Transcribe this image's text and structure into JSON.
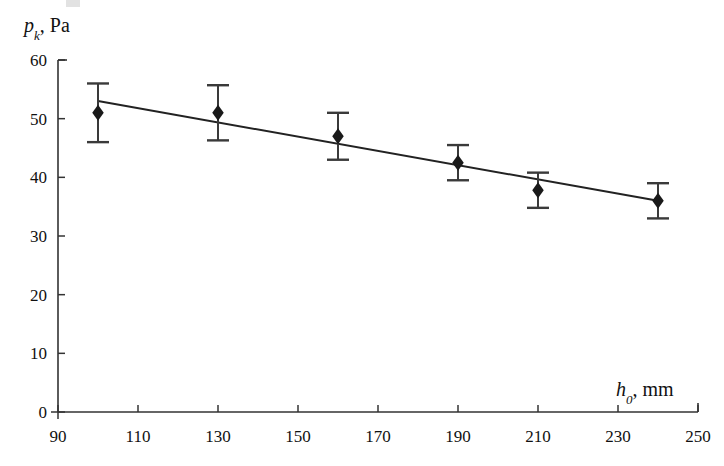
{
  "chart_data": {
    "type": "scatter",
    "title": "",
    "subtitle": "",
    "xlabel": "h_0, mm",
    "xlabel_parts": {
      "var": "h",
      "sub": "0",
      "rest": ", mm"
    },
    "ylabel": "p_k, Pa",
    "ylabel_parts": {
      "var": "p",
      "sub": "k",
      "rest": ", Pa"
    },
    "xlim": [
      90,
      250
    ],
    "ylim": [
      0,
      60
    ],
    "xticks": [
      90,
      110,
      130,
      150,
      170,
      190,
      210,
      230,
      250
    ],
    "yticks": [
      0,
      10,
      20,
      30,
      40,
      50,
      60
    ],
    "grid": false,
    "legend": "none",
    "tick_direction": "inward",
    "x": [
      100,
      130,
      160,
      190,
      210,
      240
    ],
    "values": [
      51.0,
      51.0,
      47.0,
      42.5,
      37.8,
      36.0
    ],
    "yerr": [
      5.0,
      4.7,
      4.0,
      3.0,
      3.0,
      3.0
    ],
    "marker": "diamond",
    "marker_color": "#1a1a1a",
    "errorbar_color": "#3a3a3a",
    "series": [
      {
        "name": "measured points",
        "x": [
          100,
          130,
          160,
          190,
          210,
          240
        ],
        "values": [
          51.0,
          51.0,
          47.0,
          42.5,
          37.8,
          36.0
        ],
        "yerr": [
          5.0,
          4.7,
          4.0,
          3.0,
          3.0,
          3.0
        ]
      },
      {
        "name": "linear fit",
        "type": "line",
        "x": [
          100,
          240
        ],
        "values": [
          53.0,
          36.0
        ],
        "color": "#222222"
      }
    ],
    "fit_line": {
      "x_start": 100,
      "y_start": 53.0,
      "x_end": 240,
      "y_end": 36.0
    },
    "axis_color": "#333333",
    "background": "#ffffff"
  },
  "axes": {
    "y_tick_labels": [
      "60",
      "50",
      "40",
      "30",
      "20",
      "10",
      "0"
    ],
    "x_tick_labels": [
      "90",
      "110",
      "130",
      "150",
      "170",
      "190",
      "210",
      "230",
      "250"
    ]
  }
}
